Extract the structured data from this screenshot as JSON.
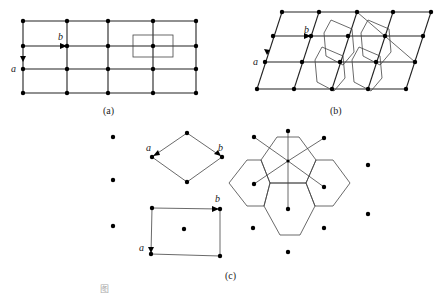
{
  "figure": {
    "panels": [
      {
        "id": "a",
        "caption": "(a)",
        "vector_labels": {
          "a": "a",
          "b": "b"
        },
        "description": "rectangular lattice 5x4 with rectangular cell"
      },
      {
        "id": "b",
        "caption": "(b)",
        "vector_labels": {
          "a": "a",
          "b": "b"
        },
        "description": "oblique lattice with hexagonal Wigner-Seitz cells"
      },
      {
        "id": "c",
        "caption": "(c)",
        "vector_labels": {
          "a1": "a",
          "b1": "b",
          "a2": "a",
          "b2": "b"
        },
        "description": "centered rectangular lattice: rhombic primitive cell, centered rectangle, hexagonal cells"
      }
    ],
    "bottom_caption": "图"
  }
}
